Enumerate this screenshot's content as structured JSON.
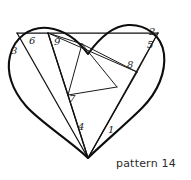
{
  "figure": {
    "title": "pattern 14",
    "shape_name": "heart-origami-crease-pattern",
    "stroke_color": "#0d0d0d",
    "background_color": "#ffffff",
    "labels": [
      {
        "id": "label-1",
        "text": "1",
        "x": 108,
        "y": 125
      },
      {
        "id": "label-2",
        "text": "2",
        "x": 149,
        "y": 27
      },
      {
        "id": "label-3",
        "text": "3",
        "x": 11,
        "y": 46
      },
      {
        "id": "label-4",
        "text": "4",
        "x": 78,
        "y": 122
      },
      {
        "id": "label-5",
        "text": "5",
        "x": 147,
        "y": 40
      },
      {
        "id": "label-6",
        "text": "6",
        "x": 29,
        "y": 36
      },
      {
        "id": "label-7",
        "text": "7",
        "x": 69,
        "y": 94
      },
      {
        "id": "label-8",
        "text": "8",
        "x": 127,
        "y": 60
      },
      {
        "id": "label-9",
        "text": "9",
        "x": 54,
        "y": 37
      }
    ],
    "caption": "pattern 14"
  },
  "geometry": {
    "heart_outline_path": "M 88 158 C 72 142 40 122 26 106 C 12 90 6 72 10 56 C 14 38 30 26 48 28 C 64 30 78 40 88 54 C 98 40 112 26 128 25 C 146 24 162 36 164 54 C 166 72 158 92 142 108 C 126 124 102 144 88 158 Z",
    "horizontal_top_line": "M 17 33 L 158 33",
    "creases": [
      "M 17 33 L 88 158",
      "M 48 33 L 88 158",
      "M 48 33 L 68 95",
      "M 68 95 L 88 158",
      "M 88 158 L 137 72",
      "M 88 158 L 158 33",
      "M 82 44 L 117 87",
      "M 117 87 L 68 95",
      "M 68 95 L 82 44",
      "M 48 33 L 137 72",
      "M 82 44 L 137 72",
      "M 158 33 L 137 72",
      "M 48 33 L 82 44"
    ]
  }
}
